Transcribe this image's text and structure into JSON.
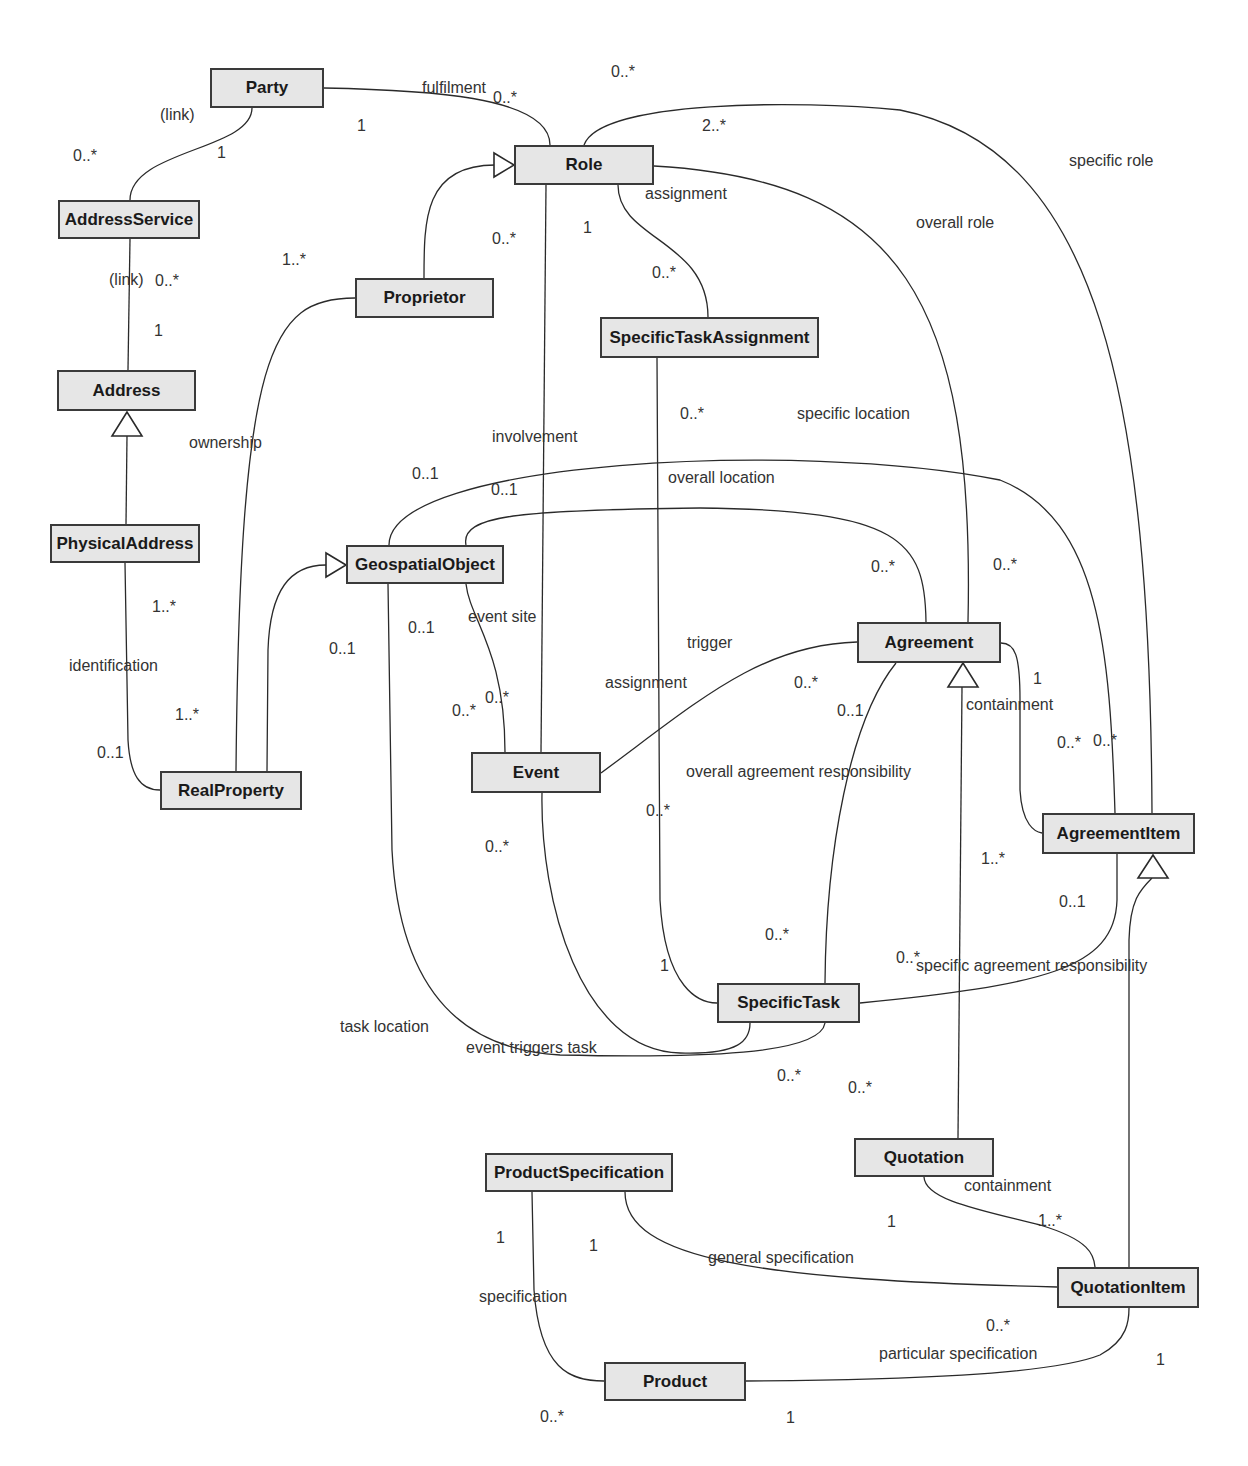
{
  "diagram": {
    "type": "UML class diagram",
    "classes": [
      {
        "id": "party",
        "name": "Party",
        "x": 210,
        "y": 68,
        "w": 114,
        "h": 40
      },
      {
        "id": "role",
        "name": "Role",
        "x": 514,
        "y": 145,
        "w": 140,
        "h": 40
      },
      {
        "id": "addressservice",
        "name": "AddressService",
        "x": 58,
        "y": 200,
        "w": 142,
        "h": 39
      },
      {
        "id": "proprietor",
        "name": "Proprietor",
        "x": 355,
        "y": 278,
        "w": 139,
        "h": 40
      },
      {
        "id": "specifictaskassignment",
        "name": "SpecificTaskAssignment",
        "x": 600,
        "y": 317,
        "w": 219,
        "h": 41
      },
      {
        "id": "address",
        "name": "Address",
        "x": 57,
        "y": 370,
        "w": 139,
        "h": 41
      },
      {
        "id": "physicaladdress",
        "name": "PhysicalAddress",
        "x": 50,
        "y": 524,
        "w": 150,
        "h": 39
      },
      {
        "id": "geospatialobject",
        "name": "GeospatialObject",
        "x": 346,
        "y": 545,
        "w": 158,
        "h": 39
      },
      {
        "id": "agreement",
        "name": "Agreement",
        "x": 857,
        "y": 622,
        "w": 144,
        "h": 41
      },
      {
        "id": "event",
        "name": "Event",
        "x": 471,
        "y": 752,
        "w": 130,
        "h": 41
      },
      {
        "id": "realproperty",
        "name": "RealProperty",
        "x": 160,
        "y": 771,
        "w": 142,
        "h": 39
      },
      {
        "id": "agreementitem",
        "name": "AgreementItem",
        "x": 1042,
        "y": 813,
        "w": 153,
        "h": 41
      },
      {
        "id": "specifictask",
        "name": "SpecificTask",
        "x": 717,
        "y": 983,
        "w": 143,
        "h": 40
      },
      {
        "id": "quotation",
        "name": "Quotation",
        "x": 854,
        "y": 1138,
        "w": 140,
        "h": 39
      },
      {
        "id": "productspecification",
        "name": "ProductSpecification",
        "x": 485,
        "y": 1153,
        "w": 188,
        "h": 39
      },
      {
        "id": "quotationitem",
        "name": "QuotationItem",
        "x": 1057,
        "y": 1267,
        "w": 142,
        "h": 41
      },
      {
        "id": "product",
        "name": "Product",
        "x": 604,
        "y": 1362,
        "w": 142,
        "h": 39
      }
    ],
    "association_labels": [
      {
        "text": "fulfilment",
        "x": 422,
        "y": 80
      },
      {
        "text": "(link)",
        "x": 160,
        "y": 107
      },
      {
        "text": "assignment",
        "x": 645,
        "y": 186
      },
      {
        "text": "specific role",
        "x": 1069,
        "y": 153
      },
      {
        "text": "overall role",
        "x": 916,
        "y": 215
      },
      {
        "text": "(link)",
        "x": 109,
        "y": 272
      },
      {
        "text": "ownership",
        "x": 189,
        "y": 435
      },
      {
        "text": "involvement",
        "x": 492,
        "y": 429
      },
      {
        "text": "specific location",
        "x": 797,
        "y": 406
      },
      {
        "text": "overall location",
        "x": 668,
        "y": 470
      },
      {
        "text": "event site",
        "x": 468,
        "y": 609
      },
      {
        "text": "trigger",
        "x": 687,
        "y": 635
      },
      {
        "text": "identification",
        "x": 69,
        "y": 658
      },
      {
        "text": "assignment",
        "x": 605,
        "y": 675
      },
      {
        "text": "containment",
        "x": 966,
        "y": 697
      },
      {
        "text": "overall agreement responsibility",
        "x": 686,
        "y": 764
      },
      {
        "text": "specific agreement responsibility",
        "x": 916,
        "y": 958
      },
      {
        "text": "task location",
        "x": 340,
        "y": 1019
      },
      {
        "text": "event triggers task",
        "x": 466,
        "y": 1040
      },
      {
        "text": "containment",
        "x": 964,
        "y": 1178
      },
      {
        "text": "general specification",
        "x": 708,
        "y": 1250
      },
      {
        "text": "specification",
        "x": 479,
        "y": 1289
      },
      {
        "text": "particular specification",
        "x": 879,
        "y": 1346
      }
    ],
    "multiplicities": [
      {
        "text": "0..*",
        "x": 611,
        "y": 64
      },
      {
        "text": "0..*",
        "x": 493,
        "y": 90
      },
      {
        "text": "2..*",
        "x": 702,
        "y": 118
      },
      {
        "text": "1",
        "x": 357,
        "y": 118
      },
      {
        "text": "0..*",
        "x": 73,
        "y": 148
      },
      {
        "text": "1",
        "x": 217,
        "y": 145
      },
      {
        "text": "0..*",
        "x": 492,
        "y": 231
      },
      {
        "text": "1",
        "x": 583,
        "y": 220
      },
      {
        "text": "1..*",
        "x": 282,
        "y": 252
      },
      {
        "text": "0..*",
        "x": 652,
        "y": 265
      },
      {
        "text": "0..*",
        "x": 155,
        "y": 273
      },
      {
        "text": "1",
        "x": 154,
        "y": 323
      },
      {
        "text": "0..*",
        "x": 680,
        "y": 406
      },
      {
        "text": "0..1",
        "x": 412,
        "y": 466
      },
      {
        "text": "0..1",
        "x": 491,
        "y": 482
      },
      {
        "text": "0..*",
        "x": 871,
        "y": 559
      },
      {
        "text": "0..*",
        "x": 993,
        "y": 557
      },
      {
        "text": "1..*",
        "x": 152,
        "y": 599
      },
      {
        "text": "0..1",
        "x": 408,
        "y": 620
      },
      {
        "text": "0..1",
        "x": 329,
        "y": 641
      },
      {
        "text": "0..*",
        "x": 794,
        "y": 675
      },
      {
        "text": "1",
        "x": 1033,
        "y": 671
      },
      {
        "text": "0..*",
        "x": 452,
        "y": 703
      },
      {
        "text": "0..*",
        "x": 485,
        "y": 690
      },
      {
        "text": "0..1",
        "x": 837,
        "y": 703
      },
      {
        "text": "1..*",
        "x": 175,
        "y": 707
      },
      {
        "text": "0..*",
        "x": 1057,
        "y": 735
      },
      {
        "text": "0..*",
        "x": 1093,
        "y": 733
      },
      {
        "text": "0..1",
        "x": 97,
        "y": 745
      },
      {
        "text": "0..*",
        "x": 646,
        "y": 803
      },
      {
        "text": "0..*",
        "x": 485,
        "y": 839
      },
      {
        "text": "1..*",
        "x": 981,
        "y": 851
      },
      {
        "text": "0..1",
        "x": 1059,
        "y": 894
      },
      {
        "text": "0..*",
        "x": 765,
        "y": 927
      },
      {
        "text": "1",
        "x": 660,
        "y": 958
      },
      {
        "text": "0..*",
        "x": 896,
        "y": 950
      },
      {
        "text": "0..*",
        "x": 777,
        "y": 1068
      },
      {
        "text": "0..*",
        "x": 848,
        "y": 1080
      },
      {
        "text": "1",
        "x": 887,
        "y": 1214
      },
      {
        "text": "1..*",
        "x": 1038,
        "y": 1213
      },
      {
        "text": "1",
        "x": 496,
        "y": 1230
      },
      {
        "text": "1",
        "x": 589,
        "y": 1238
      },
      {
        "text": "0..*",
        "x": 986,
        "y": 1318
      },
      {
        "text": "1",
        "x": 1156,
        "y": 1352
      },
      {
        "text": "0..*",
        "x": 540,
        "y": 1409
      },
      {
        "text": "1",
        "x": 786,
        "y": 1410
      }
    ]
  },
  "colors": {
    "class_fill": "#e6e6e6",
    "class_border": "#3a3a3a",
    "line": "#2a2a2a",
    "text": "#333333",
    "background": "#ffffff"
  }
}
